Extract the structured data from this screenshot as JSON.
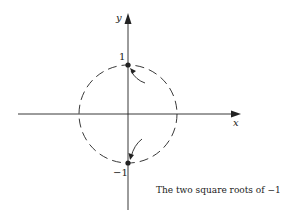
{
  "diagram": {
    "axes": {
      "x_label": "x",
      "y_label": "y"
    },
    "tick_labels": {
      "top": "1",
      "bottom": "−1"
    },
    "caption": "The two square roots of −1",
    "circle": {
      "style": "dashed",
      "center": [
        0,
        0
      ],
      "radius": 1
    },
    "points": [
      {
        "name": "i",
        "coords": [
          0,
          1
        ]
      },
      {
        "name": "-i",
        "coords": [
          0,
          -1
        ]
      }
    ],
    "colors": {
      "ink": "#222222",
      "background": "#ffffff"
    }
  }
}
